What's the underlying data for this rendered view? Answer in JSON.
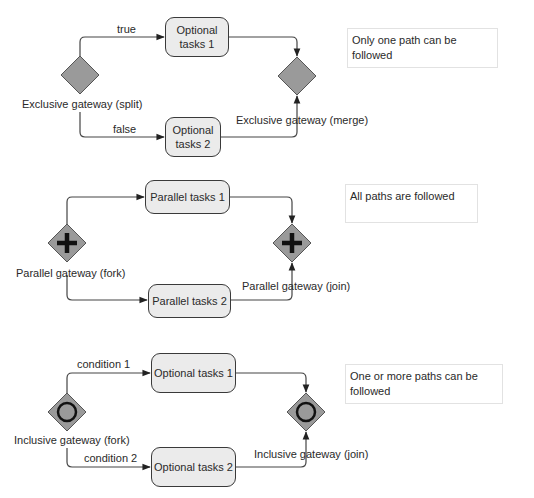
{
  "sections": [
    {
      "id": "exclusive",
      "split_label": "Exclusive gateway (split)",
      "merge_label": "Exclusive gateway (merge)",
      "upper_flow_label": "true",
      "lower_flow_label": "false",
      "task_upper": "Optional tasks 1",
      "task_upper_lines": [
        "Optional",
        "tasks 1"
      ],
      "task_lower": "Optional tasks 2",
      "task_lower_lines": [
        "Optional",
        "tasks 2"
      ],
      "note": "Only one path can be followed",
      "gateway_marker": "none"
    },
    {
      "id": "parallel",
      "split_label": "Parallel gateway (fork)",
      "merge_label": "Parallel gateway (join)",
      "task_upper": "Parallel tasks 1",
      "task_lower": "Parallel tasks 2",
      "note": "All paths are followed",
      "gateway_marker": "plus"
    },
    {
      "id": "inclusive",
      "split_label": "Inclusive gateway (fork)",
      "merge_label": "Inclusive gateway (join)",
      "upper_flow_label": "condition 1",
      "lower_flow_label": "condition 2",
      "task_upper": "Optional tasks 1",
      "task_lower": "Optional tasks 2",
      "note": "One or more paths can be followed",
      "gateway_marker": "circle"
    }
  ],
  "colors": {
    "gateway_fill": "#9a9a9a",
    "task_fill": "#ebebeb",
    "stroke": "#3a3a3a",
    "note_border": "#e2e2e2"
  }
}
